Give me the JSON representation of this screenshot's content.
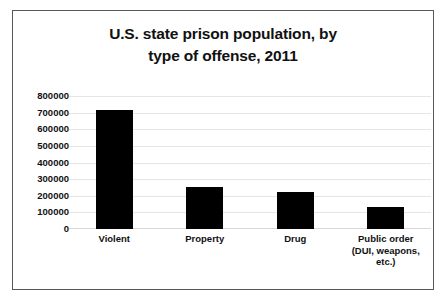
{
  "chart_data": {
    "type": "bar",
    "title": "U.S. state prison population, by type of offense, 2011",
    "title_lines": [
      "U.S. state prison population, by",
      "type of offense, 2011"
    ],
    "categories": [
      "Violent",
      "Property",
      "Drug",
      "Public order (DUI, weapons, etc.)"
    ],
    "category_lines": [
      [
        "Violent"
      ],
      [
        "Property"
      ],
      [
        "Drug"
      ],
      [
        "Public order",
        "(DUI, weapons,",
        "etc.)"
      ]
    ],
    "values": [
      717000,
      250000,
      222000,
      133000
    ],
    "xlabel": "",
    "ylabel": "",
    "ylim": [
      0,
      800000
    ],
    "ytick_step": 100000,
    "ytick_labels": [
      "800000",
      "700000",
      "600000",
      "500000",
      "400000",
      "300000",
      "200000",
      "100000",
      "0"
    ],
    "ytick_values": [
      800000,
      700000,
      600000,
      500000,
      400000,
      300000,
      200000,
      100000,
      0
    ],
    "grid": true,
    "legend": null,
    "bar_color": "#000000",
    "gridline_color": "#e6e6e6",
    "frame_color": "#58585a",
    "background_color": "#ffffff"
  }
}
